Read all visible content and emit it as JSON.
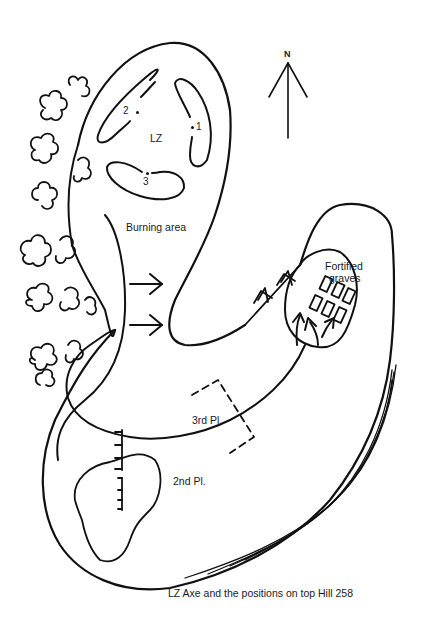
{
  "map": {
    "caption": "LZ Axe and the positions on top Hill 258",
    "compass": {
      "label": "N",
      "icon": "north-arrow-icon"
    },
    "labels": {
      "lz": "LZ",
      "position_1": "1",
      "position_2": "2",
      "position_3": "3",
      "burning_area": "Burning area",
      "fortified_graves_line1": "Fortified",
      "fortified_graves_line2": "graves",
      "third_platoon": "3rd Pl.",
      "second_platoon": "2nd Pl."
    },
    "colors": {
      "ink": "#111111",
      "background": "#ffffff"
    }
  }
}
